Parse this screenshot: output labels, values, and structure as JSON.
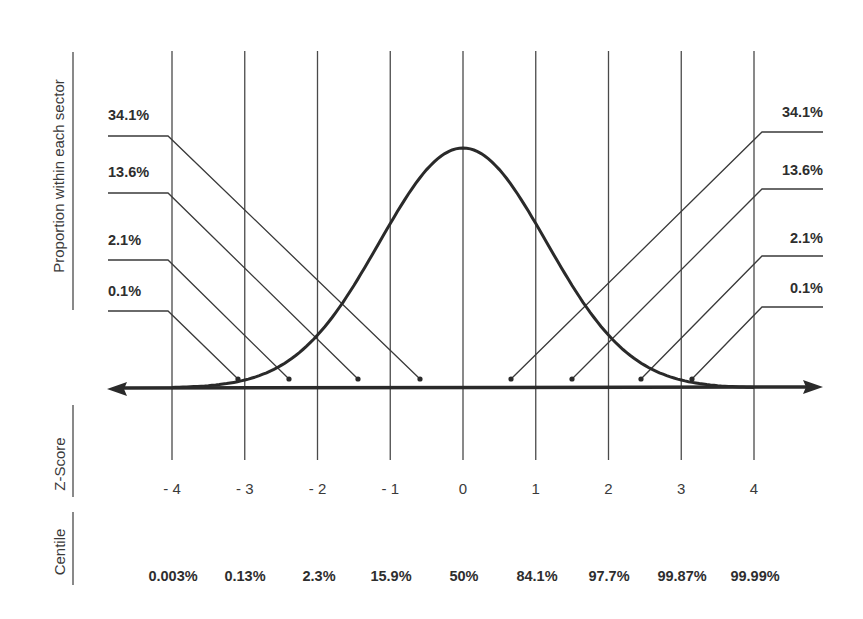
{
  "chart_data": {
    "type": "line",
    "title": "",
    "ylabel": "Proportion within each sector",
    "rows": [
      {
        "name": "Z-Score",
        "label": "Z-Score"
      },
      {
        "name": "Centile",
        "label": "Centile"
      }
    ],
    "z_scores": [
      "- 4",
      "- 3",
      "- 2",
      "- 1",
      "0",
      "1",
      "2",
      "3",
      "4"
    ],
    "z_values": [
      -4,
      -3,
      -2,
      -1,
      0,
      1,
      2,
      3,
      4
    ],
    "centiles": [
      "0.003%",
      "0.13%",
      "2.3%",
      "15.9%",
      "50%",
      "84.1%",
      "97.7%",
      "99.87%",
      "99.99%"
    ],
    "sectors_left": [
      {
        "label": "34.1%",
        "range": [
          -1,
          0
        ]
      },
      {
        "label": "13.6%",
        "range": [
          -2,
          -1
        ]
      },
      {
        "label": "2.1%",
        "range": [
          -3,
          -2
        ]
      },
      {
        "label": "0.1%",
        "range": [
          -4,
          -3
        ]
      }
    ],
    "sectors_right": [
      {
        "label": "34.1%",
        "range": [
          0,
          1
        ]
      },
      {
        "label": "13.6%",
        "range": [
          1,
          2
        ]
      },
      {
        "label": "2.1%",
        "range": [
          2,
          3
        ]
      },
      {
        "label": "0.1%",
        "range": [
          3,
          4
        ]
      }
    ],
    "xlim": [
      -4,
      4
    ],
    "grid": true,
    "curve": "bell (normal distribution)",
    "axis_arrows": "double-headed horizontal axis"
  },
  "labels": {
    "proportion": "Proportion within each sector",
    "zscore": "Z-Score",
    "centile": "Centile"
  },
  "colors": {
    "ink": "#2a2a2a",
    "grid": "#4a4a4a",
    "background": "#ffffff"
  }
}
